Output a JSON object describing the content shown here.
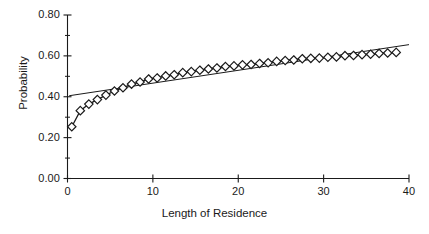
{
  "chart_data": {
    "type": "line",
    "title": "",
    "xlabel": "Length of Residence",
    "ylabel": "Probability",
    "xlim": [
      0,
      40
    ],
    "ylim": [
      0.0,
      0.8
    ],
    "grid": false,
    "legend": null,
    "xticks": [
      "0",
      "10",
      "20",
      "30",
      "40"
    ],
    "xtick_values": [
      0,
      10,
      20,
      30,
      40
    ],
    "yticks": [
      "0.00",
      "0.20",
      "0.40",
      "0.60",
      "0.80"
    ],
    "ytick_values": [
      0.0,
      0.2,
      0.4,
      0.6,
      0.8
    ],
    "minor_ticks": true,
    "series": [
      {
        "name": "Observed",
        "marker": "diamond-open",
        "x": [
          0.5,
          1.5,
          2.5,
          3.5,
          4.5,
          5.5,
          6.5,
          7.5,
          8.5,
          9.5,
          10.5,
          11.5,
          12.5,
          13.5,
          14.5,
          15.5,
          16.5,
          17.5,
          18.5,
          19.5,
          20.5,
          21.5,
          22.5,
          23.5,
          24.5,
          25.5,
          26.5,
          27.5,
          28.5,
          29.5,
          30.5,
          31.5,
          32.5,
          33.5,
          34.5,
          35.5,
          36.5,
          37.5,
          38.5
        ],
        "values": [
          0.253,
          0.332,
          0.364,
          0.386,
          0.408,
          0.428,
          0.444,
          0.462,
          0.472,
          0.487,
          0.492,
          0.502,
          0.508,
          0.518,
          0.523,
          0.53,
          0.536,
          0.541,
          0.548,
          0.551,
          0.556,
          0.558,
          0.563,
          0.566,
          0.573,
          0.577,
          0.58,
          0.586,
          0.588,
          0.589,
          0.593,
          0.595,
          0.601,
          0.602,
          0.606,
          0.608,
          0.612,
          0.614,
          0.617
        ]
      },
      {
        "name": "Fitted",
        "marker": "none",
        "x": [
          0.2,
          40.0
        ],
        "values": [
          0.405,
          0.655
        ]
      }
    ]
  },
  "axes": {
    "y_title": "Probability",
    "x_title": "Length of Residence"
  }
}
